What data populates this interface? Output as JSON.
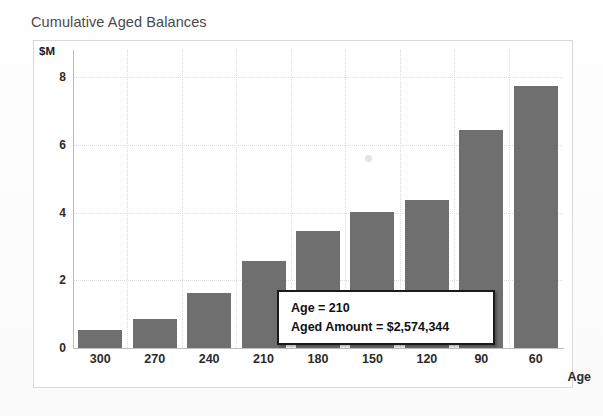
{
  "chart_data": {
    "type": "bar",
    "title": "Cumulative Aged Balances",
    "xlabel": "Age",
    "ylabel": "$M",
    "categories": [
      "300",
      "270",
      "240",
      "210",
      "180",
      "150",
      "120",
      "90",
      "60"
    ],
    "values": [
      0.52,
      0.85,
      1.63,
      2.57,
      3.47,
      4.02,
      4.38,
      6.45,
      7.75
    ],
    "ylim": [
      0,
      8.8
    ],
    "yticks": [
      "0",
      "2",
      "4",
      "6",
      "8"
    ],
    "ytick_values": [
      0,
      2,
      4,
      6,
      8
    ],
    "grid": true,
    "legend": "none",
    "series_color": "#6f6f6f",
    "annotations": {
      "tooltip": {
        "line1": "Age = 210",
        "line2": "Aged Amount = $2,574,344",
        "target_category": "210",
        "target_value": 2574344
      }
    }
  },
  "chart": {
    "title": "Cumulative Aged Balances",
    "y_axis_unit": "$M",
    "x_axis_title": "Age"
  },
  "tooltip": {
    "line1": "Age = 210",
    "line2": "Aged Amount = $2,574,344"
  }
}
